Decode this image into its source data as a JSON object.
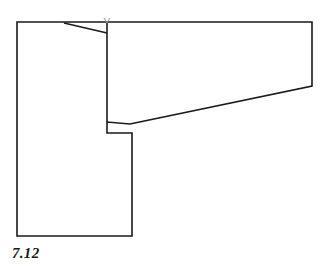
{
  "figure": {
    "caption": "7.12",
    "background_color": "#ffffff",
    "line_color": "#1a1a1a",
    "stroke_width": 1.6,
    "canvas": {
      "width": 330,
      "height": 268
    },
    "shape": {
      "name": "plan-outline",
      "description": "L-shaped building footprint with a tapering right wing",
      "outline_points": "17,22 312,22 312,86 130,124 107,122 107,133 132,133 132,236 17,236",
      "closed": true
    },
    "interior_lines": [
      {
        "name": "upper-left-diagonal",
        "points": "64,23 107,33",
        "description": "diagonal partition from upper wall down to central wall"
      },
      {
        "name": "central-vertical-wall",
        "points": "107,23 107,122",
        "description": "vertical wall dividing left block from right wing"
      }
    ],
    "marks": [
      {
        "name": "corner-tick-mark",
        "x": 107,
        "y": 20,
        "description": "small pencil tick at top of central wall"
      }
    ]
  }
}
